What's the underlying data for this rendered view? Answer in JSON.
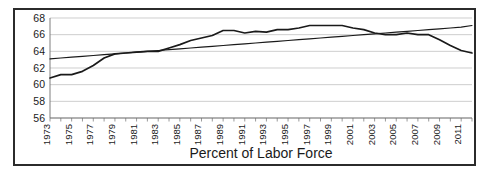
{
  "chart_data": {
    "type": "line",
    "title": "",
    "xlabel": "Percent of Labor Force",
    "ylabel": "",
    "xlim": [
      1973,
      2012
    ],
    "ylim": [
      56,
      68
    ],
    "yticks": [
      56,
      58,
      60,
      62,
      64,
      66,
      68
    ],
    "grid": true,
    "legend": "none",
    "x": [
      1973,
      1974,
      1975,
      1976,
      1977,
      1978,
      1979,
      1980,
      1981,
      1982,
      1983,
      1984,
      1985,
      1986,
      1987,
      1988,
      1989,
      1990,
      1991,
      1992,
      1993,
      1994,
      1995,
      1996,
      1997,
      1998,
      1999,
      2000,
      2001,
      2002,
      2003,
      2004,
      2005,
      2006,
      2007,
      2008,
      2009,
      2010,
      2011,
      2012
    ],
    "xticklabels": [
      "1973",
      "1975",
      "1977",
      "1979",
      "1981",
      "1983",
      "1985",
      "1987",
      "1989",
      "1991",
      "1993",
      "1995",
      "1997",
      "1999",
      "2001",
      "2003",
      "2005",
      "2007",
      "2009",
      "2011"
    ],
    "series": [
      {
        "name": "Labor Force Participation Rate",
        "color": "#1a1a1a",
        "values": [
          60.8,
          61.2,
          61.2,
          61.6,
          62.3,
          63.2,
          63.7,
          63.8,
          63.9,
          64.0,
          64.0,
          64.4,
          64.8,
          65.3,
          65.6,
          65.9,
          66.5,
          66.5,
          66.2,
          66.4,
          66.3,
          66.6,
          66.6,
          66.8,
          67.1,
          67.1,
          67.1,
          67.1,
          66.8,
          66.6,
          66.2,
          66.0,
          66.0,
          66.2,
          66.0,
          66.0,
          65.4,
          64.7,
          64.1,
          63.8
        ]
      },
      {
        "name": "Linear Trend",
        "color": "#1a1a1a",
        "values": [
          63.1,
          63.2,
          63.3,
          63.4,
          63.5,
          63.6,
          63.7,
          63.8,
          63.9,
          64.0,
          64.1,
          64.2,
          64.3,
          64.4,
          64.5,
          64.6,
          64.7,
          64.8,
          64.9,
          65.0,
          65.1,
          65.2,
          65.3,
          65.4,
          65.5,
          65.6,
          65.7,
          65.8,
          65.9,
          66.0,
          66.1,
          66.2,
          66.3,
          66.4,
          66.5,
          66.6,
          66.7,
          66.8,
          66.9,
          67.1
        ]
      }
    ]
  }
}
